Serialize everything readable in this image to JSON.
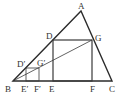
{
  "diagram": {
    "type": "geometry",
    "points": {
      "A": {
        "label": "A",
        "x": 81,
        "y": 11
      },
      "B": {
        "label": "B",
        "x": 13,
        "y": 81
      },
      "C": {
        "label": "C",
        "x": 112,
        "y": 81
      },
      "D": {
        "label": "D",
        "x": 53,
        "y": 40
      },
      "E": {
        "label": "E",
        "x": 53,
        "y": 81
      },
      "F": {
        "label": "F",
        "x": 92,
        "y": 81
      },
      "G": {
        "label": "G",
        "x": 92,
        "y": 40
      },
      "D1": {
        "label": "D′",
        "x": 26,
        "y": 68
      },
      "E1": {
        "label": "E′",
        "x": 26,
        "y": 81
      },
      "F1": {
        "label": "F′",
        "x": 39,
        "y": 81
      },
      "G1": {
        "label": "G′",
        "x": 39,
        "y": 68
      }
    },
    "labels": {
      "A": "A",
      "B": "B",
      "C": "C",
      "D": "D",
      "E": "E",
      "F": "F",
      "G": "G",
      "D1": "D′",
      "E1": "E′",
      "F1": "F′",
      "G1": "G′"
    },
    "colors": {
      "stroke": "#2b2b2b",
      "label": "#333333",
      "background": "#ffffff"
    }
  }
}
